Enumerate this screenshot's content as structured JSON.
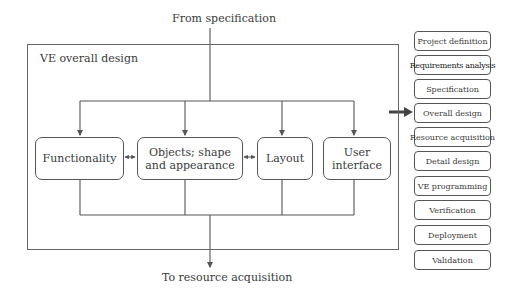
{
  "diagram": {
    "input_label": "From specification",
    "output_label": "To resource acquisition",
    "container_title": "VE overall design",
    "components": [
      {
        "label": "Functionality"
      },
      {
        "label": "Objects; shape and appearance",
        "line1": "Objects; shape",
        "line2": "and appearance"
      },
      {
        "label": "Layout"
      },
      {
        "label": "User interface",
        "line1": "User",
        "line2": "interface"
      }
    ],
    "bidirectional_links": [
      [
        "Functionality",
        "Objects; shape and appearance"
      ],
      [
        "Objects; shape and appearance",
        "Layout"
      ]
    ],
    "current_step": "Overall design",
    "process_steps": [
      {
        "label": "Project definition"
      },
      {
        "label": "Requirements analysis"
      },
      {
        "label": "Specification"
      },
      {
        "label": "Overall design"
      },
      {
        "label": "Resource acquisition"
      },
      {
        "label": "Detail design"
      },
      {
        "label": "VE programming"
      },
      {
        "label": "Verification"
      },
      {
        "label": "Deployment"
      },
      {
        "label": "Validation"
      }
    ],
    "colors": {
      "line": "#555555",
      "text": "#3a3a3a",
      "pointer_arrow": "#444444"
    }
  }
}
